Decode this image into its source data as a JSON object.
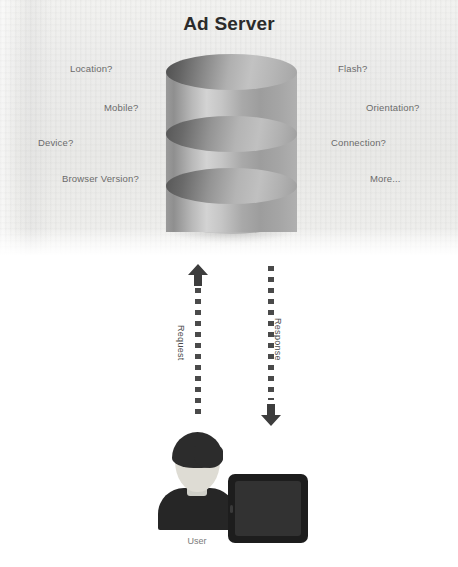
{
  "diagram": {
    "title": "Ad Server",
    "type": "ad-server-request-response-flow"
  },
  "server": {
    "node_name": "Ad Server",
    "shape": "database-cylinder",
    "attributes_left": [
      {
        "label": "Location?",
        "x": 70,
        "y": 63
      },
      {
        "label": "Mobile?",
        "x": 104,
        "y": 102
      },
      {
        "label": "Device?",
        "x": 38,
        "y": 137
      },
      {
        "label": "Browser Version?",
        "x": 62,
        "y": 173
      }
    ],
    "attributes_right": [
      {
        "label": "Flash?",
        "x": 338,
        "y": 63
      },
      {
        "label": "Orientation?",
        "x": 366,
        "y": 102
      },
      {
        "label": "Connection?",
        "x": 331,
        "y": 137
      },
      {
        "label": "More...",
        "x": 370,
        "y": 173
      }
    ]
  },
  "flows": [
    {
      "label": "Request",
      "direction": "up",
      "from": "User",
      "to": "Ad Server",
      "arrow_icon": "arrow-up-icon"
    },
    {
      "label": "Response",
      "direction": "down",
      "from": "Ad Server",
      "to": "User",
      "arrow_icon": "arrow-down-icon"
    }
  ],
  "client": {
    "caption": "User",
    "person_icon": "person-avatar-icon",
    "device_icon": "tablet-icon"
  },
  "colors": {
    "title": "#2b2b2b",
    "label": "#6b6b6b",
    "flow": "#4a4a4a",
    "band": "#ececea",
    "cylinder_light": "#d3d3d3",
    "cylinder_dark": "#4f4f4f",
    "device": "#1d1d1d",
    "page": "#ffffff"
  }
}
